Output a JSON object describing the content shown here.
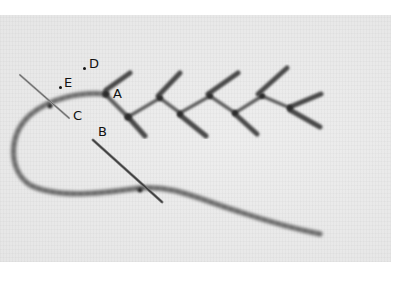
{
  "figure": {
    "labels": {
      "A": "A",
      "B": "B",
      "C": "C",
      "D": "D",
      "E": "E"
    },
    "colors": {
      "fabric": "#ececec",
      "yarn": "#6e6e6e",
      "yarn_dark": "#3a3a3a",
      "needle": "#8a8a8a",
      "page_background": "#ffffff"
    }
  }
}
